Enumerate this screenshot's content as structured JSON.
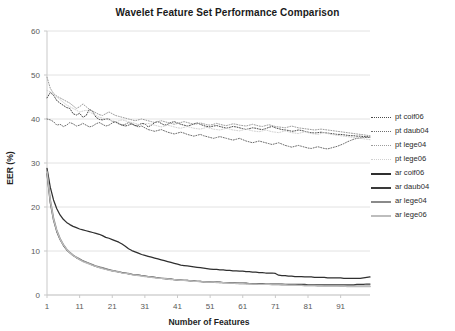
{
  "chart_data": {
    "type": "line",
    "title": "Wavelet Feature Set Performance Comparison",
    "xlabel": "Number of Features",
    "ylabel": "EER (%)",
    "xlim": [
      1,
      100
    ],
    "ylim": [
      0,
      60
    ],
    "ytick_labels": [
      "0",
      "10",
      "20",
      "30",
      "40",
      "50",
      "60"
    ],
    "yticks": [
      0,
      10,
      20,
      30,
      40,
      50,
      60
    ],
    "xtick_labels": [
      "1",
      "11",
      "21",
      "31",
      "41",
      "51",
      "61",
      "71",
      "81",
      "91"
    ],
    "xticks": [
      1,
      11,
      21,
      31,
      41,
      51,
      61,
      71,
      81,
      91
    ],
    "grid": "horizontal",
    "legend_position": "right",
    "series": [
      {
        "name": "pt coif06",
        "style": "dotted",
        "color": "#4a4a4a",
        "values": [
          44.8,
          46.0,
          45.4,
          44.2,
          43.6,
          43.1,
          42.6,
          42.4,
          41.2,
          40.9,
          41.3,
          40.4,
          40.8,
          42.2,
          41.7,
          40.4,
          39.9,
          39.8,
          40.0,
          40.0,
          39.5,
          39.3,
          38.9,
          38.6,
          38.4,
          38.6,
          38.9,
          38.5,
          38.6,
          39.0,
          38.9,
          38.2,
          38.6,
          39.2,
          39.4,
          39.0,
          38.6,
          38.8,
          39.2,
          39.4,
          39.1,
          38.8,
          38.6,
          38.4,
          38.6,
          38.9,
          39.1,
          38.8,
          38.5,
          38.3,
          38.2,
          38.4,
          38.5,
          38.3,
          38.1,
          37.9,
          38.1,
          38.3,
          38.2,
          38.0,
          37.8,
          37.6,
          37.8,
          38.0,
          37.9,
          37.7,
          37.6,
          37.8,
          38.1,
          38.3,
          38.0,
          37.8,
          37.6,
          37.5,
          37.4,
          37.2,
          37.3,
          37.5,
          37.4,
          37.2,
          37.0,
          36.9,
          36.8,
          36.9,
          37.0,
          36.9,
          36.8,
          36.7,
          36.6,
          36.5,
          36.5,
          36.4,
          36.3,
          36.2,
          36.2,
          36.1,
          36.1,
          36.0,
          36.0,
          35.9
        ]
      },
      {
        "name": "pt daub04",
        "style": "dotted",
        "color": "#6e6e6e",
        "values": [
          40.0,
          39.8,
          39.4,
          38.6,
          38.8,
          38.3,
          38.6,
          39.2,
          38.9,
          38.4,
          38.6,
          39.0,
          38.6,
          38.2,
          38.4,
          38.9,
          39.2,
          38.8,
          38.4,
          38.6,
          39.1,
          39.4,
          39.0,
          38.6,
          38.8,
          39.2,
          38.9,
          38.5,
          38.2,
          38.4,
          38.0,
          37.6,
          37.4,
          37.2,
          37.4,
          37.6,
          37.3,
          37.0,
          36.8,
          36.6,
          36.8,
          37.0,
          36.8,
          36.5,
          36.3,
          36.1,
          36.3,
          36.5,
          36.2,
          36.0,
          35.8,
          35.6,
          35.8,
          36.0,
          35.8,
          35.6,
          35.4,
          35.2,
          35.4,
          35.6,
          35.3,
          35.0,
          34.8,
          34.6,
          34.8,
          35.0,
          34.8,
          34.6,
          34.4,
          34.2,
          34.4,
          34.6,
          34.3,
          34.0,
          33.8,
          33.6,
          33.8,
          34.0,
          33.8,
          33.6,
          33.4,
          33.3,
          33.5,
          33.7,
          33.5,
          33.3,
          33.2,
          33.4,
          33.6,
          33.8,
          34.1,
          34.4,
          34.8,
          35.1,
          35.4,
          35.6,
          35.7,
          35.8,
          35.8,
          35.8
        ]
      },
      {
        "name": "pt lege04",
        "style": "dotted",
        "color": "#9c9c9c",
        "values": [
          49.5,
          47.0,
          45.8,
          45.2,
          44.8,
          44.4,
          44.0,
          43.6,
          43.0,
          42.4,
          42.8,
          43.4,
          42.8,
          42.2,
          41.8,
          41.4,
          41.0,
          40.8,
          41.2,
          41.6,
          41.2,
          40.8,
          40.6,
          40.4,
          40.2,
          40.0,
          39.8,
          39.6,
          39.8,
          40.0,
          39.8,
          39.6,
          39.4,
          39.2,
          39.4,
          39.6,
          39.4,
          39.2,
          39.0,
          38.8,
          39.0,
          39.2,
          39.4,
          39.2,
          39.0,
          38.8,
          38.9,
          39.1,
          38.9,
          38.7,
          38.6,
          38.8,
          39.0,
          38.8,
          38.6,
          38.5,
          38.7,
          38.9,
          38.8,
          38.6,
          38.5,
          38.4,
          38.6,
          38.8,
          38.6,
          38.4,
          38.3,
          38.5,
          38.7,
          38.5,
          38.3,
          38.2,
          38.1,
          38.0,
          38.2,
          38.4,
          38.2,
          38.0,
          37.9,
          37.8,
          37.7,
          37.6,
          37.5,
          37.6,
          37.7,
          37.6,
          37.5,
          37.4,
          37.3,
          37.2,
          37.1,
          37.0,
          36.9,
          36.8,
          36.7,
          36.6,
          36.5,
          36.4,
          36.3,
          36.2
        ]
      },
      {
        "name": "pt lege06",
        "style": "dotted",
        "color": "#d0d0d0",
        "values": [
          46.5,
          46.2,
          45.6,
          45.0,
          44.4,
          43.8,
          43.2,
          42.8,
          42.4,
          42.0,
          41.6,
          41.8,
          42.0,
          41.6,
          41.2,
          40.8,
          40.4,
          40.2,
          40.0,
          39.8,
          39.6,
          39.4,
          39.6,
          39.8,
          39.6,
          39.4,
          39.2,
          39.0,
          38.8,
          38.6,
          38.8,
          39.0,
          38.8,
          38.6,
          38.4,
          38.2,
          38.4,
          38.6,
          38.4,
          38.2,
          38.0,
          37.9,
          38.1,
          38.3,
          38.1,
          37.9,
          37.8,
          37.7,
          37.9,
          38.1,
          37.9,
          37.7,
          37.6,
          37.5,
          37.7,
          37.9,
          37.7,
          37.5,
          37.4,
          37.3,
          37.5,
          37.7,
          37.5,
          37.3,
          37.2,
          37.1,
          37.3,
          37.5,
          37.3,
          37.1,
          37.0,
          36.9,
          37.1,
          37.3,
          37.1,
          36.9,
          36.8,
          36.7,
          36.9,
          37.1,
          36.9,
          36.7,
          36.6,
          36.5,
          36.7,
          36.9,
          36.7,
          36.5,
          36.4,
          36.3,
          36.2,
          36.1,
          36.0,
          35.9,
          35.8,
          35.7,
          35.6,
          35.5,
          35.4,
          35.3
        ]
      },
      {
        "name": "ar coif06",
        "style": "solid",
        "color": "#2f2f2f",
        "values": [
          28.8,
          24.5,
          21.6,
          19.6,
          18.2,
          17.2,
          16.5,
          16.0,
          15.6,
          15.3,
          15.0,
          14.8,
          14.6,
          14.4,
          14.2,
          14.0,
          13.8,
          13.5,
          13.1,
          12.9,
          12.6,
          12.3,
          12.0,
          11.6,
          11.1,
          10.5,
          10.1,
          9.8,
          9.5,
          9.2,
          9.0,
          8.8,
          8.6,
          8.4,
          8.2,
          8.0,
          7.8,
          7.6,
          7.4,
          7.2,
          7.0,
          6.8,
          6.7,
          6.6,
          6.5,
          6.4,
          6.3,
          6.2,
          6.1,
          6.0,
          5.9,
          5.8,
          5.8,
          5.7,
          5.7,
          5.6,
          5.6,
          5.5,
          5.5,
          5.4,
          5.4,
          5.3,
          5.3,
          5.2,
          5.2,
          5.1,
          5.1,
          5.0,
          5.0,
          5.0,
          4.9,
          4.5,
          4.4,
          4.4,
          4.3,
          4.3,
          4.2,
          4.2,
          4.2,
          4.1,
          4.1,
          4.1,
          4.0,
          4.0,
          4.0,
          4.0,
          3.9,
          3.9,
          3.9,
          3.9,
          3.9,
          3.8,
          3.8,
          3.8,
          3.8,
          3.8,
          3.8,
          3.9,
          4.0,
          4.1
        ]
      },
      {
        "name": "ar daub04",
        "style": "solid",
        "color": "#3a3a3a",
        "values": [
          27.6,
          21.0,
          17.0,
          14.4,
          12.6,
          11.3,
          10.3,
          9.6,
          9.0,
          8.5,
          8.1,
          7.7,
          7.4,
          7.1,
          6.8,
          6.5,
          6.3,
          6.1,
          5.9,
          5.7,
          5.5,
          5.4,
          5.2,
          5.1,
          5.0,
          4.8,
          4.7,
          4.6,
          4.5,
          4.4,
          4.3,
          4.2,
          4.1,
          4.0,
          3.9,
          3.8,
          3.7,
          3.6,
          3.6,
          3.5,
          3.4,
          3.4,
          3.3,
          3.3,
          3.2,
          3.2,
          3.1,
          3.1,
          3.0,
          3.0,
          3.0,
          2.9,
          2.9,
          2.9,
          2.8,
          2.8,
          2.8,
          2.8,
          2.7,
          2.7,
          2.7,
          2.7,
          2.6,
          2.6,
          2.6,
          2.6,
          2.6,
          2.5,
          2.5,
          2.5,
          2.5,
          2.5,
          2.5,
          2.4,
          2.4,
          2.4,
          2.4,
          2.4,
          2.4,
          2.4,
          2.3,
          2.3,
          2.3,
          2.3,
          2.3,
          2.3,
          2.3,
          2.3,
          2.3,
          2.3,
          2.3,
          2.3,
          2.3,
          2.3,
          2.3,
          2.4,
          2.4,
          2.4,
          2.5,
          2.5
        ]
      },
      {
        "name": "ar lege04",
        "style": "solid",
        "color": "#8a8a8a",
        "values": [
          28.2,
          21.8,
          17.6,
          14.8,
          12.9,
          11.5,
          10.5,
          9.7,
          9.1,
          8.6,
          8.2,
          7.8,
          7.5,
          7.2,
          6.9,
          6.6,
          6.4,
          6.2,
          6.0,
          5.8,
          5.6,
          5.4,
          5.3,
          5.1,
          5.0,
          4.9,
          4.7,
          4.6,
          4.5,
          4.4,
          4.3,
          4.2,
          4.1,
          4.0,
          3.9,
          3.8,
          3.8,
          3.7,
          3.6,
          3.5,
          3.5,
          3.4,
          3.3,
          3.3,
          3.2,
          3.2,
          3.1,
          3.1,
          3.0,
          3.0,
          2.9,
          2.9,
          2.9,
          2.8,
          2.8,
          2.8,
          2.7,
          2.7,
          2.7,
          2.6,
          2.6,
          2.6,
          2.6,
          2.5,
          2.5,
          2.5,
          2.5,
          2.4,
          2.4,
          2.4,
          2.4,
          2.4,
          2.3,
          2.3,
          2.3,
          2.3,
          2.3,
          2.2,
          2.2,
          2.2,
          2.2,
          2.2,
          2.2,
          2.1,
          2.1,
          2.1,
          2.1,
          2.1,
          2.1,
          2.1,
          2.0,
          2.0,
          2.0,
          2.0,
          2.0,
          2.0,
          2.0,
          2.0,
          2.0,
          2.0
        ]
      },
      {
        "name": "ar lege06",
        "style": "solid",
        "color": "#bdbdbd",
        "values": [
          28.0,
          21.4,
          17.2,
          14.6,
          12.7,
          11.4,
          10.4,
          9.6,
          9.0,
          8.5,
          8.0,
          7.6,
          7.3,
          7.0,
          6.7,
          6.5,
          6.2,
          6.0,
          5.8,
          5.6,
          5.5,
          5.3,
          5.2,
          5.0,
          4.9,
          4.8,
          4.6,
          4.5,
          4.4,
          4.3,
          4.2,
          4.1,
          4.0,
          3.9,
          3.8,
          3.8,
          3.7,
          3.6,
          3.5,
          3.5,
          3.4,
          3.3,
          3.3,
          3.2,
          3.2,
          3.1,
          3.1,
          3.0,
          3.0,
          2.9,
          2.9,
          2.9,
          2.8,
          2.8,
          2.8,
          2.7,
          2.7,
          2.7,
          2.6,
          2.6,
          2.6,
          2.5,
          2.5,
          2.5,
          2.5,
          2.4,
          2.4,
          2.4,
          2.4,
          2.3,
          2.3,
          2.3,
          2.3,
          2.3,
          2.2,
          2.2,
          2.2,
          2.2,
          2.2,
          2.1,
          2.1,
          2.1,
          2.1,
          2.1,
          2.1,
          2.0,
          2.0,
          2.0,
          2.0,
          2.0,
          2.0,
          2.0,
          1.9,
          1.9,
          1.9,
          1.9,
          1.9,
          1.9,
          1.9,
          1.9
        ]
      }
    ]
  },
  "legend": {
    "items": [
      {
        "label": "pt coif06"
      },
      {
        "label": "pt daub04"
      },
      {
        "label": "pt lege04"
      },
      {
        "label": "pt lege06"
      },
      {
        "label": "ar coif06"
      },
      {
        "label": "ar daub04"
      },
      {
        "label": "ar lege04"
      },
      {
        "label": "ar lege06"
      }
    ]
  },
  "colors": {
    "background": "#ffffff",
    "grid": "#e2e2e2",
    "axis": "#c9c9c9",
    "text": "#595959",
    "title": "#1a1a1a"
  }
}
